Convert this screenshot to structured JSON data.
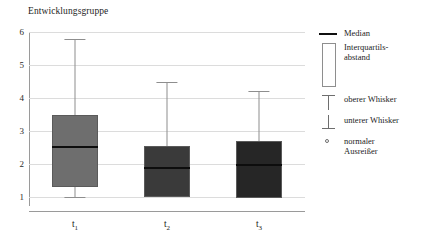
{
  "chart_data": {
    "type": "box",
    "title": "Entwicklungsgruppe",
    "xlabel": "",
    "ylabel": "",
    "ylim": [
      0.72,
      6.0
    ],
    "yticks": [
      6,
      5,
      4,
      3,
      2,
      1
    ],
    "grid": true,
    "categories": [
      "t1",
      "t2",
      "t3"
    ],
    "category_labels": [
      "t",
      "t",
      "t"
    ],
    "category_subscripts": [
      "1",
      "2",
      "3"
    ],
    "boxes": [
      {
        "name": "t1",
        "whisker_low": 1.0,
        "q1": 1.3,
        "median": 2.5,
        "q3": 3.47,
        "whisker_high": 5.8,
        "fill": "#6e6e6e",
        "outliers": []
      },
      {
        "name": "t2",
        "whisker_low": 1.0,
        "q1": 1.0,
        "median": 1.87,
        "q3": 2.55,
        "whisker_high": 4.47,
        "fill": "#3a3a3a",
        "outliers": []
      },
      {
        "name": "t3",
        "whisker_low": 0.95,
        "q1": 0.95,
        "median": 1.95,
        "q3": 2.7,
        "whisker_high": 4.2,
        "fill": "#262626",
        "outliers": []
      }
    ],
    "legend": {
      "position": "right",
      "entries": [
        {
          "key": "median-line",
          "label": "Median"
        },
        {
          "key": "iqr-box",
          "label": "Interquartils-\nabstand"
        },
        {
          "key": "upper-whisker",
          "label": "oberer Whisker"
        },
        {
          "key": "lower-whisker",
          "label": "unterer Whisker"
        },
        {
          "key": "outlier-marker",
          "label": "normaler\nAusreißer"
        }
      ]
    },
    "colors": {
      "grid": "#dcdcdc",
      "axis": "#9a9a9a",
      "whisker": "#8e8e8e",
      "median": "#0d0d0d",
      "box_border": "#5a5a5a",
      "text": "#1d1d1d"
    }
  }
}
